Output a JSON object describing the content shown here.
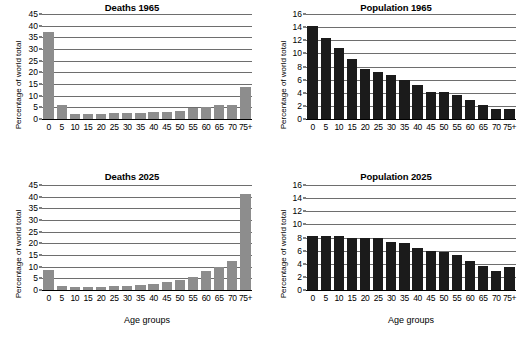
{
  "figure": {
    "ylabel": "Percentage of world total",
    "xlabel": "Age groups",
    "categories": [
      "0",
      "5",
      "10",
      "15",
      "20",
      "25",
      "30",
      "35",
      "40",
      "45",
      "50",
      "55",
      "60",
      "65",
      "70",
      "75+"
    ],
    "colors": {
      "deaths_bar": "#8d8d8d",
      "population_bar": "#1b1b1b",
      "gridline": "#6e6e6e",
      "axis": "#000000",
      "background": "#ffffff"
    }
  },
  "chart_data": [
    {
      "type": "bar",
      "title": "Deaths 1965",
      "xlabel": "",
      "ylabel": "Percentage of world total",
      "categories": [
        "0",
        "5",
        "10",
        "15",
        "20",
        "25",
        "30",
        "35",
        "40",
        "45",
        "50",
        "55",
        "60",
        "65",
        "70",
        "75+"
      ],
      "values": [
        37.5,
        6.2,
        2.2,
        2.2,
        2.1,
        2.7,
        2.4,
        2.4,
        2.9,
        3.1,
        3.6,
        4.8,
        5.2,
        5.8,
        6.2,
        13.9
      ],
      "ylim": [
        0,
        45
      ],
      "yticks": [
        0,
        5,
        10,
        15,
        20,
        25,
        30,
        35,
        40,
        45
      ],
      "grid": true,
      "legend": "none"
    },
    {
      "type": "bar",
      "title": "Population 1965",
      "xlabel": "",
      "ylabel": "Percentage of world total",
      "categories": [
        "0",
        "5",
        "10",
        "15",
        "20",
        "25",
        "30",
        "35",
        "40",
        "45",
        "50",
        "55",
        "60",
        "65",
        "70",
        "75+"
      ],
      "values": [
        14.2,
        12.3,
        10.8,
        9.1,
        7.6,
        7.1,
        6.7,
        6.0,
        5.2,
        4.1,
        4.1,
        3.6,
        2.9,
        2.2,
        1.6,
        1.6
      ],
      "ylim": [
        0,
        16
      ],
      "yticks": [
        0,
        2,
        4,
        6,
        8,
        10,
        12,
        14,
        16
      ],
      "grid": true,
      "legend": "none"
    },
    {
      "type": "bar",
      "title": "Deaths 2025",
      "xlabel": "Age groups",
      "ylabel": "Percentage of world total",
      "categories": [
        "0",
        "5",
        "10",
        "15",
        "20",
        "25",
        "30",
        "35",
        "40",
        "45",
        "50",
        "55",
        "60",
        "65",
        "70",
        "75+"
      ],
      "values": [
        8.7,
        1.9,
        1.3,
        1.3,
        1.3,
        1.8,
        1.8,
        2.0,
        2.5,
        3.4,
        4.3,
        5.7,
        8.0,
        9.9,
        12.5,
        41.0
      ],
      "ylim": [
        0,
        45
      ],
      "yticks": [
        0,
        5,
        10,
        15,
        20,
        25,
        30,
        35,
        40,
        45
      ],
      "grid": true,
      "legend": "none"
    },
    {
      "type": "bar",
      "title": "Population 2025",
      "xlabel": "Age groups",
      "ylabel": "Percentage of world total",
      "categories": [
        "0",
        "5",
        "10",
        "15",
        "20",
        "25",
        "30",
        "35",
        "40",
        "45",
        "50",
        "55",
        "60",
        "65",
        "70",
        "75+"
      ],
      "values": [
        8.3,
        8.2,
        8.2,
        8.0,
        8.0,
        8.0,
        7.3,
        7.1,
        6.4,
        6.0,
        5.8,
        5.4,
        4.4,
        3.6,
        2.9,
        3.5
      ],
      "ylim": [
        0,
        16
      ],
      "yticks": [
        0,
        2,
        4,
        6,
        8,
        10,
        12,
        14,
        16
      ],
      "grid": true,
      "legend": "none"
    }
  ]
}
